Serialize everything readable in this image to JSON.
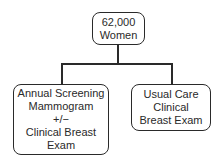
{
  "diagram": {
    "type": "tree",
    "root": {
      "lines": [
        "62,000",
        "Women"
      ]
    },
    "children": [
      {
        "lines": [
          "Annual Screening",
          "Mammogram",
          "+/−",
          "Clinical Breast",
          "Exam"
        ]
      },
      {
        "lines": [
          "Usual Care",
          "Clinical",
          "Breast Exam"
        ]
      }
    ],
    "colors": {
      "stroke": "#2a2a2a",
      "background": "#ffffff"
    }
  }
}
